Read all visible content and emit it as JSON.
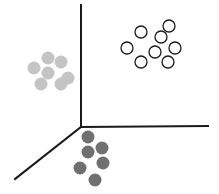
{
  "diagram": {
    "colors": {
      "background": "#ffffff",
      "axis": "#1a1a1a",
      "cluster_open_stroke": "#1a1a1a",
      "cluster_light_fill": "#c4c4c4",
      "cluster_dark_fill": "#707070"
    },
    "axes": {
      "origin": [
        81,
        127
      ],
      "vertical_end": [
        81,
        5
      ],
      "horizontal_end": [
        208,
        126
      ],
      "diagonal_end": [
        15,
        179
      ]
    },
    "clusters": [
      {
        "name": "open-circles",
        "style": "outline",
        "radius": 6,
        "points": [
          [
            141,
            32
          ],
          [
            169,
            26
          ],
          [
            161,
            37
          ],
          [
            127,
            48
          ],
          [
            155,
            52
          ],
          [
            175,
            48
          ],
          [
            141,
            62
          ],
          [
            168,
            62
          ]
        ]
      },
      {
        "name": "light-gray",
        "style": "filled",
        "radius": 6.5,
        "points": [
          [
            48,
            58
          ],
          [
            61,
            62
          ],
          [
            34,
            68
          ],
          [
            48,
            73
          ],
          [
            68,
            78
          ],
          [
            41,
            84
          ],
          [
            61,
            84
          ]
        ]
      },
      {
        "name": "dark-gray",
        "style": "filled",
        "radius": 6.5,
        "points": [
          [
            88,
            137
          ],
          [
            88,
            152
          ],
          [
            102,
            148
          ],
          [
            80,
            168
          ],
          [
            103,
            163
          ],
          [
            95,
            180
          ]
        ]
      }
    ]
  }
}
